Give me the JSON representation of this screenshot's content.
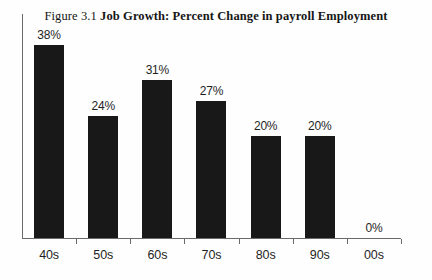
{
  "title": {
    "figure_number": "Figure 3.1",
    "main": "Job Growth: Percent Change in payroll Employment",
    "full": "Figure 3.1 Job Growth: Percent Change in payroll Employment"
  },
  "colors": {
    "bar": "#181818",
    "axis": "#6a6a6a",
    "text": "#1f1f1f",
    "background": "#fefefe"
  },
  "chart_data": {
    "type": "bar",
    "title": "Figure 3.1 Job Growth: Percent Change in payroll Employment",
    "xlabel": "",
    "ylabel": "",
    "ylim": [
      0,
      44
    ],
    "grid": false,
    "legend": false,
    "value_suffix": "%",
    "categories": [
      "40s",
      "50s",
      "60s",
      "70s",
      "80s",
      "90s",
      "00s"
    ],
    "values": [
      38,
      24,
      31,
      27,
      20,
      20,
      0
    ],
    "labels": [
      "38%",
      "24%",
      "31%",
      "27%",
      "20%",
      "20%",
      "0%"
    ]
  }
}
